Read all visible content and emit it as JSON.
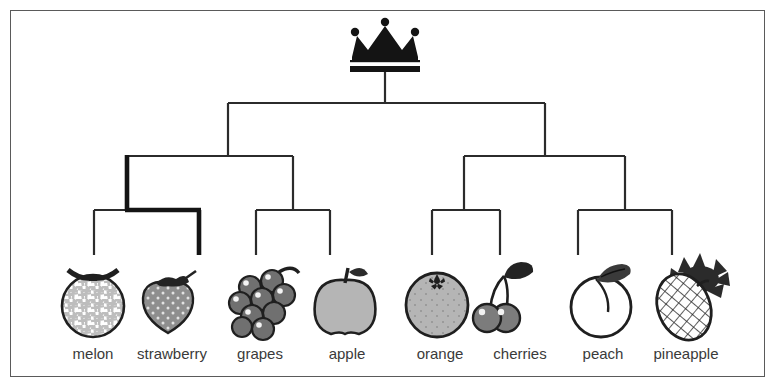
{
  "figure": {
    "type": "hierarchical-tree-diagram",
    "title": "",
    "root_icon": "crown-icon",
    "border_color": "#5a5a5a",
    "line_color": "#2b2b2b",
    "highlight_color": "#1a1a1a",
    "background": "#ffffff"
  },
  "tree": {
    "root": {
      "name": "crown-root",
      "x": 385,
      "y": 62
    },
    "levels": 4,
    "highlighted_path": [
      "left-group",
      "melon-strawberry-node",
      "strawberry-leaf"
    ],
    "internal_nodes": [
      {
        "name": "left-group",
        "x": 228,
        "y": 155,
        "children": [
          "melon-strawberry-node",
          "grapes-apple-node"
        ]
      },
      {
        "name": "right-group",
        "x": 545,
        "y": 155,
        "children": [
          "orange-cherries-node",
          "peach-pineapple-node"
        ]
      },
      {
        "name": "melon-strawberry-node",
        "x": 127,
        "y": 209,
        "children": [
          "melon",
          "strawberry"
        ]
      },
      {
        "name": "grapes-apple-node",
        "x": 293,
        "y": 209,
        "children": [
          "grapes",
          "apple"
        ]
      },
      {
        "name": "orange-cherries-node",
        "x": 464,
        "y": 209,
        "children": [
          "orange",
          "cherries"
        ]
      },
      {
        "name": "peach-pineapple-node",
        "x": 625,
        "y": 209,
        "children": [
          "peach",
          "pineapple"
        ]
      }
    ]
  },
  "leaves": [
    {
      "id": "melon",
      "label": "melon",
      "icon": "melon-icon",
      "x": 93,
      "fill": "#c9c9c9"
    },
    {
      "id": "strawberry",
      "label": "strawberry",
      "icon": "strawberry-icon",
      "x": 168,
      "fill": "#8e8e8e"
    },
    {
      "id": "grapes",
      "label": "grapes",
      "icon": "grapes-icon",
      "x": 258,
      "fill": "#6f6f6f"
    },
    {
      "id": "apple",
      "label": "apple",
      "icon": "apple-icon",
      "x": 345,
      "fill": "#b5b5b5"
    },
    {
      "id": "orange",
      "label": "orange",
      "icon": "orange-icon",
      "x": 437,
      "fill": "#b5b5b5"
    },
    {
      "id": "cherries",
      "label": "cherries",
      "icon": "cherries-icon",
      "x": 518,
      "fill": "#8e8e8e"
    },
    {
      "id": "peach",
      "label": "peach",
      "icon": "peach-icon",
      "x": 601,
      "fill": "#ffffff"
    },
    {
      "id": "pineapple",
      "label": "pineapple",
      "icon": "pineapple-icon",
      "x": 684,
      "fill": "#ffffff"
    }
  ],
  "labels_row": {
    "y": 355,
    "items": [
      "melon",
      "strawberry",
      "grapes",
      "apple",
      "orange",
      "cherries",
      "peach",
      "pineapple"
    ]
  }
}
